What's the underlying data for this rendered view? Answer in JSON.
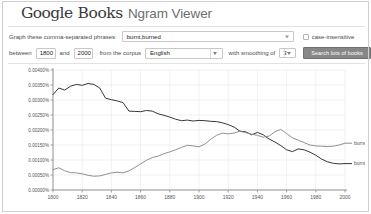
{
  "header": {
    "logo_google": "Google",
    "logo_books": "Books",
    "app_title": "Ngram Viewer"
  },
  "query": {
    "phrase_label": "Graph these comma-separated phrases:",
    "phrase_value": "burnt,burned",
    "phrase_placeholder": "burnt,burned",
    "case_insensitive_label": "case-insensitive",
    "case_insensitive_checked": false,
    "between_label": "between",
    "start_year": "1800",
    "and_label": "and",
    "end_year": "2000",
    "corpus_label": "from the corpus",
    "corpus_value": "English",
    "smoothing_label": "with smoothing of",
    "smoothing_value": "3",
    "search_button": "Search lots of books"
  },
  "chart_data": {
    "type": "line",
    "title": "",
    "xlabel": "",
    "ylabel": "",
    "xlim": [
      1800,
      2000
    ],
    "ylim": [
      0,
      0.004
    ],
    "grid": true,
    "legend_position": "right-inline",
    "y_unit": "%",
    "xticks": [
      1800,
      1820,
      1840,
      1860,
      1880,
      1900,
      1920,
      1940,
      1960,
      1980,
      2000
    ],
    "yticks": [
      0.0,
      0.0005,
      0.001,
      0.0015,
      0.002,
      0.0025,
      0.003,
      0.0035,
      0.004
    ],
    "ytick_labels": [
      "0.00000%",
      "0.00050%",
      "0.00100%",
      "0.00150%",
      "0.00200%",
      "0.00250%",
      "0.00300%",
      "0.00350%",
      "0.00400%"
    ],
    "x": [
      1800,
      1804,
      1808,
      1812,
      1816,
      1820,
      1824,
      1828,
      1832,
      1836,
      1840,
      1844,
      1848,
      1852,
      1856,
      1860,
      1864,
      1868,
      1872,
      1876,
      1880,
      1884,
      1888,
      1892,
      1896,
      1900,
      1904,
      1908,
      1912,
      1916,
      1920,
      1924,
      1928,
      1932,
      1936,
      1940,
      1944,
      1948,
      1952,
      1956,
      1960,
      1964,
      1968,
      1972,
      1976,
      1980,
      1984,
      1988,
      1992,
      1996,
      2000
    ],
    "series": [
      {
        "name": "burnt",
        "color": "#2b2b2b",
        "label_x": 2000,
        "values": [
          0.00318,
          0.0034,
          0.00333,
          0.00346,
          0.00352,
          0.00349,
          0.00355,
          0.00352,
          0.0034,
          0.00306,
          0.00301,
          0.00297,
          0.00291,
          0.00263,
          0.00262,
          0.00261,
          0.00265,
          0.00263,
          0.00254,
          0.00249,
          0.00243,
          0.00236,
          0.00231,
          0.00233,
          0.0023,
          0.00232,
          0.00231,
          0.00229,
          0.00228,
          0.00224,
          0.00218,
          0.0021,
          0.00196,
          0.00194,
          0.00184,
          0.00192,
          0.00184,
          0.0017,
          0.0016,
          0.00148,
          0.00134,
          0.00128,
          0.00137,
          0.00134,
          0.00126,
          0.00116,
          0.00103,
          0.00094,
          0.00089,
          0.00087,
          0.00088
        ]
      },
      {
        "name": "burned",
        "color": "#8a8a8a",
        "label_x": 2000,
        "values": [
          0.00068,
          0.00074,
          0.00064,
          0.00058,
          0.00057,
          0.00054,
          0.00049,
          0.00046,
          0.00047,
          0.00052,
          0.00057,
          0.00059,
          0.00057,
          0.00064,
          0.00075,
          0.00087,
          0.00099,
          0.00108,
          0.00113,
          0.00121,
          0.00127,
          0.00134,
          0.00142,
          0.00149,
          0.00147,
          0.00144,
          0.00153,
          0.00169,
          0.00182,
          0.0019,
          0.00187,
          0.0019,
          0.00196,
          0.00191,
          0.00186,
          0.00182,
          0.00176,
          0.0018,
          0.00194,
          0.00202,
          0.00188,
          0.00174,
          0.00166,
          0.00158,
          0.0015,
          0.00147,
          0.00146,
          0.00145,
          0.00146,
          0.0015,
          0.00156
        ]
      }
    ]
  }
}
